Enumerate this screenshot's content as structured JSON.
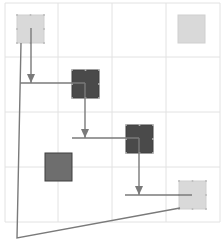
{
  "grid": {
    "cols": 4,
    "rows": 4,
    "x_lines": [
      5,
      58,
      112,
      166,
      220
    ],
    "y_lines": [
      3,
      57,
      112,
      167,
      222
    ],
    "line_color": "#e2e2e2"
  },
  "colors": {
    "light": "#d9d9d9",
    "dark": "#4a4a4a",
    "mid": "#6e6e6e",
    "connector": "#7a7a7a"
  },
  "nodes": [
    {
      "id": "n1",
      "x": 17,
      "y": 15,
      "w": 27,
      "h": 28,
      "shade": "light",
      "selected": true
    },
    {
      "id": "n2",
      "x": 178,
      "y": 15,
      "w": 27,
      "h": 28,
      "shade": "light",
      "selected": false
    },
    {
      "id": "n3",
      "x": 72,
      "y": 70,
      "w": 27,
      "h": 28,
      "shade": "dark",
      "selected": true
    },
    {
      "id": "n4",
      "x": 126,
      "y": 125,
      "w": 27,
      "h": 28,
      "shade": "dark",
      "selected": true
    },
    {
      "id": "n5",
      "x": 45,
      "y": 153,
      "w": 27,
      "h": 28,
      "shade": "mid",
      "selected": false
    },
    {
      "id": "n6",
      "x": 179,
      "y": 181,
      "w": 27,
      "h": 28,
      "shade": "light",
      "selected": true
    }
  ],
  "connectors": [
    {
      "id": "c1",
      "points": [
        [
          31,
          28
        ],
        [
          31,
          83
        ]
      ],
      "arrow": true
    },
    {
      "id": "c2",
      "points": [
        [
          20,
          83
        ],
        [
          85,
          83
        ]
      ],
      "arrow": false
    },
    {
      "id": "c3",
      "points": [
        [
          85,
          83
        ],
        [
          85,
          138
        ]
      ],
      "arrow": true
    },
    {
      "id": "c4",
      "points": [
        [
          72,
          138
        ],
        [
          139,
          138
        ]
      ],
      "arrow": false
    },
    {
      "id": "c5",
      "points": [
        [
          139,
          138
        ],
        [
          139,
          195
        ]
      ],
      "arrow": true
    },
    {
      "id": "c6",
      "points": [
        [
          125,
          195
        ],
        [
          192,
          195
        ]
      ],
      "arrow": false
    },
    {
      "id": "c7",
      "points": [
        [
          21,
          43
        ],
        [
          17,
          238
        ],
        [
          180,
          208
        ]
      ],
      "arrow": false
    }
  ]
}
